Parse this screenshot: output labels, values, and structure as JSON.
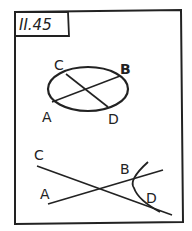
{
  "card": {
    "title": "II.45"
  },
  "figure_top": {
    "labels": {
      "C": "C",
      "B": "B",
      "A": "A",
      "D": "D"
    }
  },
  "figure_bottom": {
    "labels": {
      "C": "C",
      "A": "A",
      "B": "B",
      "D": "D"
    }
  },
  "colors": {
    "ink": "#222222",
    "paper": "#ffffff"
  }
}
